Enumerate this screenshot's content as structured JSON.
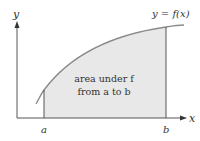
{
  "diagram": {
    "axis_x_label": "x",
    "axis_y_label": "y",
    "curve_label": "y = f(x)",
    "region_label_line1": "area under f",
    "region_label_line2": "from a to b",
    "point_a_label": "a",
    "point_b_label": "b",
    "colors": {
      "fill": "#e8e8e8",
      "curve": "#8a8a8a",
      "axes": "#333333",
      "text": "#333333"
    }
  }
}
